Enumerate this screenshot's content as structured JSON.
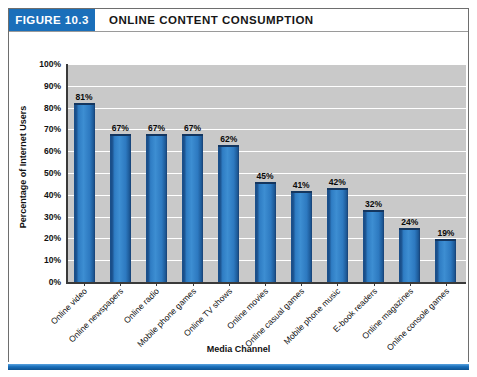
{
  "figure": {
    "number_label": "FIGURE 10.3",
    "title": "ONLINE CONTENT CONSUMPTION",
    "accent_color": "#1a6fba",
    "plot_background": "#c9c9c9",
    "bar_color": "#3d8ed2",
    "bar_shade_dark": "#1a4f8a"
  },
  "chart_data": {
    "type": "bar",
    "title": "ONLINE CONTENT CONSUMPTION",
    "xlabel": "Media Channel",
    "ylabel": "Percentage of Internet Users",
    "ylim": [
      0,
      100
    ],
    "grid": true,
    "legend": "none",
    "ytick_labels": [
      "100%",
      "90%",
      "80%",
      "70%",
      "60%",
      "50%",
      "40%",
      "30%",
      "20%",
      "10%",
      "0%"
    ],
    "ytick_values": [
      100,
      90,
      80,
      70,
      60,
      50,
      40,
      30,
      20,
      10,
      0
    ],
    "categories": [
      "Online video",
      "Online newspapers",
      "Online radio",
      "Mobile phone games",
      "Online TV shows",
      "Online movies",
      "Online casual games",
      "Mobile phone music",
      "E-book readers",
      "Online magazines",
      "Online console games"
    ],
    "values": [
      81,
      67,
      67,
      67,
      62,
      45,
      41,
      42,
      32,
      24,
      19
    ],
    "data_labels": [
      "81%",
      "67%",
      "67%",
      "67%",
      "62%",
      "45%",
      "41%",
      "42%",
      "32%",
      "24%",
      "19%"
    ]
  }
}
